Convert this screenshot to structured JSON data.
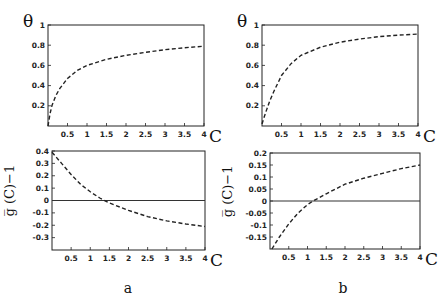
{
  "chart_data": [
    {
      "id": "a_top",
      "panel": "a",
      "type": "line",
      "title": "",
      "xlabel": "C",
      "ylabel": "θ",
      "xlim": [
        0,
        4
      ],
      "ylim": [
        0,
        1
      ],
      "xticks": [
        0.5,
        1,
        1.5,
        2,
        2.5,
        3,
        3.5,
        4
      ],
      "xtick_labels": [
        "0.5",
        "1",
        "1.5",
        "2",
        "2.5",
        "3",
        "3.5",
        "4"
      ],
      "yticks": [
        0.2,
        0.4,
        0.6,
        0.8,
        1
      ],
      "ytick_labels": [
        "0.2",
        "0.4",
        "0.6",
        "0.8",
        "1"
      ],
      "grid": false,
      "zero_line": false,
      "frame": {
        "x": 48,
        "y": 25,
        "w": 156,
        "h": 101
      },
      "series": [
        {
          "name": "θ(C)",
          "style": "dashed",
          "x": [
            0.0,
            0.05,
            0.1,
            0.2,
            0.3,
            0.5,
            0.75,
            1.0,
            1.5,
            2.0,
            2.5,
            3.0,
            3.5,
            4.0
          ],
          "y": [
            0.0,
            0.12,
            0.2,
            0.3,
            0.37,
            0.47,
            0.55,
            0.6,
            0.66,
            0.7,
            0.73,
            0.755,
            0.775,
            0.79
          ]
        }
      ]
    },
    {
      "id": "b_top",
      "panel": "b",
      "type": "line",
      "title": "",
      "xlabel": "C",
      "ylabel": "θ",
      "xlim": [
        0,
        4
      ],
      "ylim": [
        0,
        1
      ],
      "xticks": [
        0.5,
        1,
        1.5,
        2,
        2.5,
        3,
        3.5,
        4
      ],
      "xtick_labels": [
        "0.5",
        "1",
        "1.5",
        "2",
        "2.5",
        "3",
        "3.5",
        "4"
      ],
      "yticks": [
        0.2,
        0.4,
        0.6,
        0.8,
        1
      ],
      "ytick_labels": [
        "0.2",
        "0.4",
        "0.6",
        "0.8",
        "1"
      ],
      "grid": false,
      "zero_line": false,
      "frame": {
        "x": 262,
        "y": 25,
        "w": 156,
        "h": 101
      },
      "series": [
        {
          "name": "θ(C)",
          "style": "dashed",
          "x": [
            0.0,
            0.05,
            0.1,
            0.2,
            0.3,
            0.5,
            0.75,
            1.0,
            1.5,
            2.0,
            2.5,
            3.0,
            3.5,
            4.0
          ],
          "y": [
            0.02,
            0.08,
            0.14,
            0.25,
            0.34,
            0.5,
            0.62,
            0.7,
            0.78,
            0.83,
            0.86,
            0.885,
            0.9,
            0.91
          ]
        }
      ]
    },
    {
      "id": "a_bottom",
      "panel": "a",
      "type": "line",
      "title": "",
      "xlabel": "C",
      "ylabel": "g̅ (C)−1",
      "xlim": [
        0,
        4
      ],
      "ylim": [
        -0.4,
        0.4
      ],
      "xticks": [
        0.5,
        1,
        1.5,
        2,
        2.5,
        3,
        3.5,
        4
      ],
      "xtick_labels": [
        "0.5",
        "1",
        "1.5",
        "2",
        "2.5",
        "3",
        "3.5",
        "4"
      ],
      "yticks": [
        -0.3,
        -0.2,
        -0.1,
        0,
        0.1,
        0.2,
        0.3,
        0.4
      ],
      "ytick_labels": [
        "-0.3",
        "-0.2",
        "-0.1",
        "0",
        "0.1",
        "0.2",
        "0.3",
        "0.4"
      ],
      "grid": false,
      "zero_line": true,
      "frame": {
        "x": 52,
        "y": 151,
        "w": 153,
        "h": 99
      },
      "series": [
        {
          "name": "g̅(C)−1",
          "style": "dashed",
          "x": [
            0.0,
            0.25,
            0.5,
            0.75,
            1.0,
            1.25,
            1.5,
            2.0,
            2.5,
            3.0,
            3.5,
            4.0
          ],
          "y": [
            0.39,
            0.3,
            0.21,
            0.13,
            0.07,
            0.02,
            -0.02,
            -0.08,
            -0.13,
            -0.165,
            -0.19,
            -0.21
          ]
        }
      ]
    },
    {
      "id": "b_bottom",
      "panel": "b",
      "type": "line",
      "title": "",
      "xlabel": "C",
      "ylabel": "g̅ (C)−1",
      "xlim": [
        0,
        4
      ],
      "ylim": [
        -0.2,
        0.2
      ],
      "xticks": [
        0.5,
        1,
        1.5,
        2,
        2.5,
        3,
        3.5,
        4
      ],
      "xtick_labels": [
        "0.5",
        "1",
        "1.5",
        "2",
        "2.5",
        "3",
        "3.5",
        "4"
      ],
      "yticks": [
        -0.15,
        -0.1,
        -0.05,
        0,
        0.05,
        0.1,
        0.15,
        0.2
      ],
      "ytick_labels": [
        "-0.15",
        "-0.1",
        "-0.05",
        "0",
        "0.05",
        "0.1",
        "0.15",
        "0.2"
      ],
      "grid": false,
      "zero_line": true,
      "frame": {
        "x": 270,
        "y": 153,
        "w": 150,
        "h": 96
      },
      "series": [
        {
          "name": "g̅(C)−1",
          "style": "dashed",
          "x": [
            0.05,
            0.25,
            0.5,
            0.75,
            1.0,
            1.15,
            1.5,
            2.0,
            2.5,
            3.0,
            3.5,
            4.0
          ],
          "y": [
            -0.2,
            -0.15,
            -0.095,
            -0.05,
            -0.015,
            0.0,
            0.03,
            0.07,
            0.095,
            0.115,
            0.135,
            0.15
          ]
        }
      ]
    }
  ],
  "panel_labels": {
    "a": "a",
    "b": "b"
  },
  "axis_labels": {
    "theta": "θ",
    "g": "g̅ (C)−1",
    "c": "C"
  }
}
